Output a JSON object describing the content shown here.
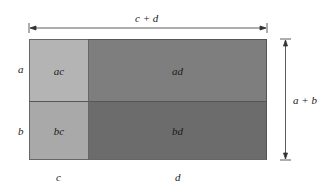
{
  "diagram": {
    "top_dimension": "c + d",
    "right_dimension": "a + b",
    "row_labels": [
      "a",
      "b"
    ],
    "column_labels": [
      "c",
      "d"
    ],
    "regions": [
      {
        "label": "ac",
        "row": "a",
        "col": "c",
        "color": "#b4b4b4"
      },
      {
        "label": "ad",
        "row": "a",
        "col": "d",
        "color": "#7e7e7e"
      },
      {
        "label": "bc",
        "row": "b",
        "col": "c",
        "color": "#a9a9a9"
      },
      {
        "label": "bd",
        "row": "b",
        "col": "d",
        "color": "#6c6c6c"
      }
    ],
    "colors": {
      "outline": "#555555",
      "arrow": "#333333"
    }
  }
}
